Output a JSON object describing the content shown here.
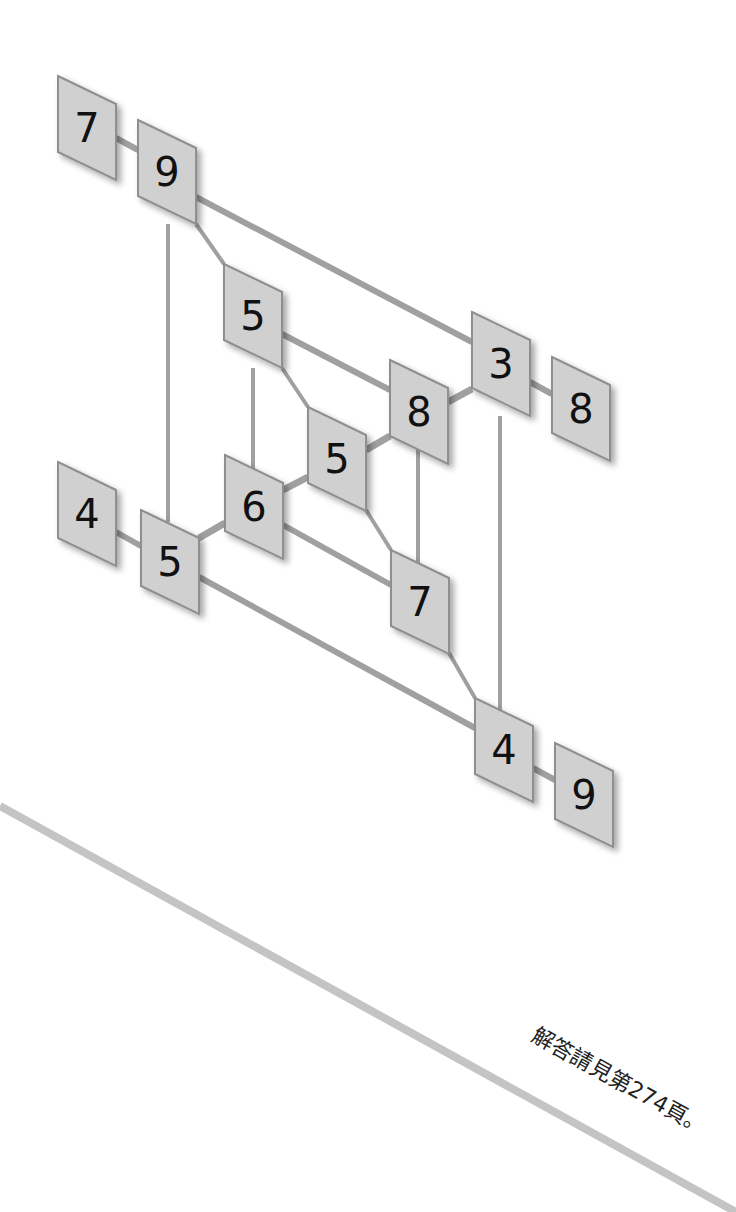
{
  "figure": {
    "type": "number-grid-puzzle",
    "tile_color": "#d0d0d0",
    "tile_border_color": "#8f8f8f",
    "edge_color": "#a0a0a0",
    "text_color": "#111111"
  },
  "tiles": [
    {
      "id": "t-7-top",
      "label": "7",
      "x": 58,
      "y": 76
    },
    {
      "id": "t-9-top",
      "label": "9",
      "x": 138,
      "y": 120
    },
    {
      "id": "t-5-upper",
      "label": "5",
      "x": 224,
      "y": 264
    },
    {
      "id": "t-3-right",
      "label": "3",
      "x": 472,
      "y": 312
    },
    {
      "id": "t-8-outer-right",
      "label": "8",
      "x": 552,
      "y": 357
    },
    {
      "id": "t-8-center",
      "label": "8",
      "x": 390,
      "y": 360
    },
    {
      "id": "t-5-center",
      "label": "5",
      "x": 308,
      "y": 407
    },
    {
      "id": "t-6-center",
      "label": "6",
      "x": 225,
      "y": 455
    },
    {
      "id": "t-4-left",
      "label": "4",
      "x": 58,
      "y": 462
    },
    {
      "id": "t-5-lower-left",
      "label": "5",
      "x": 141,
      "y": 510
    },
    {
      "id": "t-7-lower",
      "label": "7",
      "x": 391,
      "y": 550
    },
    {
      "id": "t-4-bottom",
      "label": "4",
      "x": 475,
      "y": 698
    },
    {
      "id": "t-9-bottom",
      "label": "9",
      "x": 555,
      "y": 743
    }
  ],
  "edges": [
    {
      "from": "t-7-top",
      "to": "t-9-top",
      "x1": 116,
      "y1": 138,
      "x2": 138,
      "y2": 150,
      "weight": "normal"
    },
    {
      "from": "t-9-top",
      "to": "t-3-right",
      "x1": 196,
      "y1": 197,
      "x2": 472,
      "y2": 342,
      "weight": "normal"
    },
    {
      "from": "t-9-top",
      "to": "t-5-upper",
      "x1": 196,
      "y1": 224,
      "x2": 224,
      "y2": 264,
      "weight": "thin"
    },
    {
      "from": "t-9-top",
      "to": "t-5-lower-left",
      "x1": 168,
      "y1": 224,
      "x2": 168,
      "y2": 522,
      "weight": "thin"
    },
    {
      "from": "t-5-upper",
      "to": "t-8-center",
      "x1": 282,
      "y1": 334,
      "x2": 390,
      "y2": 390,
      "weight": "normal"
    },
    {
      "from": "t-5-upper",
      "to": "t-6-center",
      "x1": 253,
      "y1": 368,
      "x2": 253,
      "y2": 470,
      "weight": "thin"
    },
    {
      "from": "t-5-upper",
      "to": "t-5-center",
      "x1": 282,
      "y1": 368,
      "x2": 308,
      "y2": 407,
      "weight": "thin"
    },
    {
      "from": "t-8-center",
      "to": "t-3-right",
      "x1": 448,
      "y1": 402,
      "x2": 472,
      "y2": 389,
      "weight": "thick"
    },
    {
      "from": "t-3-right",
      "to": "t-8-outer-right",
      "x1": 530,
      "y1": 382,
      "x2": 552,
      "y2": 394,
      "weight": "normal"
    },
    {
      "from": "t-3-right",
      "to": "t-4-bottom",
      "x1": 500,
      "y1": 416,
      "x2": 500,
      "y2": 710,
      "weight": "thin"
    },
    {
      "from": "t-5-center",
      "to": "t-8-center",
      "x1": 366,
      "y1": 450,
      "x2": 390,
      "y2": 436,
      "weight": "thick"
    },
    {
      "from": "t-8-center",
      "to": "t-7-lower",
      "x1": 418,
      "y1": 450,
      "x2": 418,
      "y2": 565,
      "weight": "thin"
    },
    {
      "from": "t-5-center",
      "to": "t-7-lower",
      "x1": 366,
      "y1": 510,
      "x2": 391,
      "y2": 550,
      "weight": "thin"
    },
    {
      "from": "t-6-center",
      "to": "t-5-center",
      "x1": 283,
      "y1": 490,
      "x2": 308,
      "y2": 477,
      "weight": "thick"
    },
    {
      "from": "t-6-center",
      "to": "t-7-lower",
      "x1": 283,
      "y1": 525,
      "x2": 391,
      "y2": 585,
      "weight": "normal"
    },
    {
      "from": "t-5-lower-left",
      "to": "t-6-center",
      "x1": 199,
      "y1": 538,
      "x2": 225,
      "y2": 523,
      "weight": "thick"
    },
    {
      "from": "t-4-left",
      "to": "t-5-lower-left",
      "x1": 116,
      "y1": 532,
      "x2": 141,
      "y2": 546,
      "weight": "normal"
    },
    {
      "from": "t-5-lower-left",
      "to": "t-4-bottom",
      "x1": 199,
      "y1": 577,
      "x2": 475,
      "y2": 728,
      "weight": "normal"
    },
    {
      "from": "t-7-lower",
      "to": "t-4-bottom",
      "x1": 449,
      "y1": 653,
      "x2": 475,
      "y2": 698,
      "weight": "thin"
    },
    {
      "from": "t-4-bottom",
      "to": "t-9-bottom",
      "x1": 533,
      "y1": 768,
      "x2": 555,
      "y2": 780,
      "weight": "normal"
    }
  ],
  "footer": {
    "diagonal_stroke": {
      "x1": 0,
      "y1": 806,
      "x2": 736,
      "y2": 1212,
      "color": "#c4c4c4"
    },
    "answer_note": "解答請見第274頁。",
    "answer_note_angle_deg": 29
  }
}
